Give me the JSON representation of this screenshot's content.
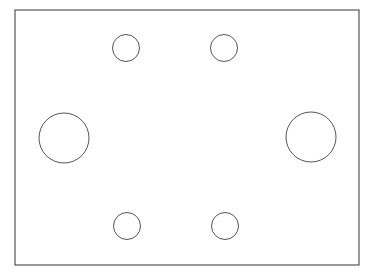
{
  "diagram": {
    "stroke_color": "#555555",
    "background": "#ffffff",
    "plate": {
      "x": 15,
      "y": 10,
      "width": 344,
      "height": 255
    },
    "holes": [
      {
        "name": "hole-top-left",
        "cx": 126,
        "cy": 48,
        "r": 13.5
      },
      {
        "name": "hole-top-right",
        "cx": 224,
        "cy": 48,
        "r": 13.5
      },
      {
        "name": "hole-middle-left",
        "cx": 64,
        "cy": 138,
        "r": 25
      },
      {
        "name": "hole-middle-right",
        "cx": 311,
        "cy": 137,
        "r": 25
      },
      {
        "name": "hole-bottom-left",
        "cx": 127,
        "cy": 226,
        "r": 13.5
      },
      {
        "name": "hole-bottom-right",
        "cx": 225,
        "cy": 226,
        "r": 13.5
      }
    ]
  }
}
